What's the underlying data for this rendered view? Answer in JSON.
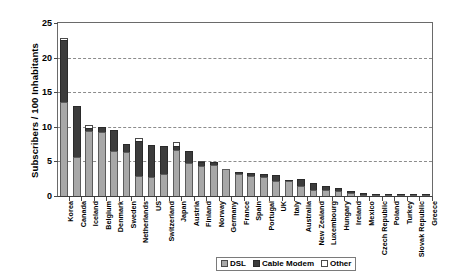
{
  "chart_data": {
    "type": "bar",
    "subtype": "stacked-bar",
    "title": "",
    "subtitle": "",
    "xlabel": "",
    "ylabel": "Subscribers / 100 Inhabitants",
    "ylim": [
      0,
      25
    ],
    "yticks": [
      0,
      5,
      10,
      15,
      20,
      25
    ],
    "grid": "horizontal-dashed",
    "legend_position": "bottom-center",
    "categories": [
      "Korea",
      "Canada",
      "Iceland",
      "Belgium",
      "Denmark",
      "Sweden",
      "Netherlands",
      "US",
      "Switzerland",
      "Japan",
      "Austria",
      "Finland",
      "Norway",
      "Germany",
      "France",
      "Spain",
      "Portugal",
      "UK",
      "Italy",
      "Australia",
      "New Zealand",
      "Luxembourg",
      "Hungary",
      "Ireland",
      "Mexico",
      "Czech Republic",
      "Poland",
      "Turkey",
      "Slovak Republic",
      "Greece"
    ],
    "series": [
      {
        "name": "DSL",
        "color": "#a8a8a8",
        "values": [
          13.5,
          5.6,
          9.3,
          9.2,
          6.5,
          6.3,
          2.8,
          2.7,
          3.2,
          6.6,
          4.7,
          4.3,
          4.4,
          3.8,
          3.2,
          2.8,
          2.7,
          2.1,
          2.1,
          1.4,
          0.8,
          0.9,
          0.7,
          0.5,
          0.2,
          0.2,
          0.2,
          0.1,
          0.05,
          0.05
        ]
      },
      {
        "name": "Cable Modem",
        "color": "#3c3c3c",
        "values": [
          8.8,
          7.2,
          0.4,
          0.6,
          3.0,
          1.1,
          5.0,
          4.6,
          4.0,
          0.6,
          1.7,
          0.6,
          0.4,
          0.0,
          0.3,
          0.5,
          0.4,
          0.9,
          0.1,
          1.0,
          1.0,
          0.5,
          0.5,
          0.2,
          0.3,
          0.1,
          0.05,
          0.02,
          0.02,
          0.02
        ]
      },
      {
        "name": "Other",
        "color": "#ffffff",
        "values": [
          0.3,
          0.0,
          0.5,
          0.0,
          0.0,
          0.0,
          0.5,
          0.0,
          0.0,
          0.5,
          0.0,
          0.1,
          0.0,
          0.0,
          0.0,
          0.0,
          0.0,
          0.0,
          0.0,
          0.0,
          0.0,
          0.0,
          0.0,
          0.0,
          0.0,
          0.0,
          0.0,
          0.0,
          0.0,
          0.0
        ]
      }
    ],
    "totals": [
      22.6,
      12.8,
      10.2,
      9.8,
      9.5,
      7.4,
      8.3,
      7.3,
      7.2,
      7.7,
      6.4,
      5.0,
      4.8,
      3.8,
      3.5,
      3.3,
      3.1,
      3.0,
      2.2,
      2.4,
      1.8,
      1.4,
      1.2,
      0.7,
      0.5,
      0.3,
      0.25,
      0.12,
      0.07,
      0.07
    ]
  },
  "legend": {
    "items": [
      {
        "label": "DSL",
        "swatch": "dsl-swatch-icon"
      },
      {
        "label": "Cable Modem",
        "swatch": "cable-modem-swatch-icon"
      },
      {
        "label": "Other",
        "swatch": "other-swatch-icon"
      }
    ]
  }
}
